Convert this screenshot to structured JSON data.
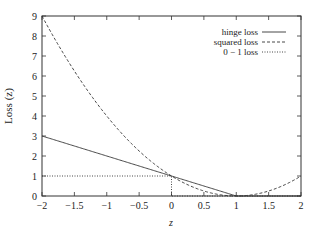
{
  "chart_data": {
    "type": "line",
    "title": "",
    "xlabel": "z",
    "ylabel": "Loss (z)",
    "xlim": [
      -2,
      2
    ],
    "ylim": [
      0,
      9
    ],
    "grid": false,
    "legend_position": "upper-right",
    "x_ticks": [
      -2,
      -1.5,
      -1,
      -0.5,
      0,
      0.5,
      1,
      1.5,
      2
    ],
    "x_tick_labels": [
      "−2",
      "−1.5",
      "−1",
      "−0.5",
      "0",
      "0.5",
      "1",
      "1.5",
      "2"
    ],
    "y_ticks": [
      0,
      1,
      2,
      3,
      4,
      5,
      6,
      7,
      8,
      9
    ],
    "y_tick_labels": [
      "0",
      "1",
      "2",
      "3",
      "4",
      "5",
      "6",
      "7",
      "8",
      "9"
    ],
    "series": [
      {
        "name": "hinge loss",
        "style": "solid",
        "formula": "max(0, 1 - z)",
        "x": [
          -2,
          -1.5,
          -1,
          -0.5,
          0,
          0.5,
          1,
          1.5,
          2
        ],
        "values": [
          3,
          2.5,
          2,
          1.5,
          1,
          0.5,
          0,
          0,
          0
        ]
      },
      {
        "name": "squared loss",
        "style": "dashed",
        "formula": "(1 - z)^2",
        "x": [
          -2,
          -1.5,
          -1,
          -0.5,
          0,
          0.5,
          1,
          1.5,
          2
        ],
        "values": [
          9,
          6.25,
          4,
          2.25,
          1,
          0.25,
          0,
          0.25,
          1
        ]
      },
      {
        "name": "0 − 1 loss",
        "style": "dotted",
        "formula": "1 for z <= 0, else 0",
        "x": [
          -2,
          -1.5,
          -1,
          -0.5,
          0,
          0,
          0.5,
          1,
          1.5,
          2
        ],
        "values": [
          1,
          1,
          1,
          1,
          1,
          0,
          0,
          0,
          0,
          0
        ]
      }
    ]
  }
}
